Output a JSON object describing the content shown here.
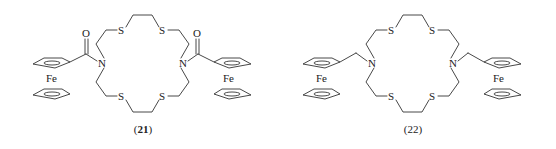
{
  "figure": {
    "compounds": [
      {
        "id": "21",
        "label_open": "(",
        "label_num": "21",
        "label_close": ")",
        "label_bold": true,
        "linker": "carbonyl",
        "atoms": {
          "n_left": "N",
          "n_right": "N",
          "s_top_left": "S",
          "s_top_right": "S",
          "s_bottom_left": "S",
          "s_bottom_right": "S",
          "o_left": "O",
          "o_right": "O",
          "fe_left": "Fe",
          "fe_right": "Fe"
        }
      },
      {
        "id": "22",
        "label_open": "(",
        "label_num": "22",
        "label_close": ")",
        "label_bold": false,
        "linker": "methylene",
        "atoms": {
          "n_left": "N",
          "n_right": "N",
          "s_top_left": "S",
          "s_top_right": "S",
          "s_bottom_left": "S",
          "s_bottom_right": "S",
          "fe_left": "Fe",
          "fe_right": "Fe"
        }
      }
    ]
  }
}
